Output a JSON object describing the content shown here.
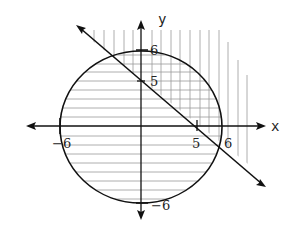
{
  "diagram": {
    "type": "graph-of-inequalities",
    "axes": {
      "x_label": "x",
      "y_label": "y"
    },
    "ticks": {
      "x_pos5": "5",
      "x_pos6": "6",
      "x_neg6": "−6",
      "y_pos5": "5",
      "y_pos6": "6",
      "y_neg6": "−6"
    },
    "curves": [
      {
        "name": "circle",
        "equation": "x^2 + y^2 = 36",
        "shading": "horizontal lines inside"
      },
      {
        "name": "line",
        "equation": "x + y = 5",
        "shading": "vertical lines above"
      }
    ],
    "colors": {
      "stroke": "#111111",
      "hatch": "#9a9a9a",
      "background": "#ffffff"
    }
  }
}
